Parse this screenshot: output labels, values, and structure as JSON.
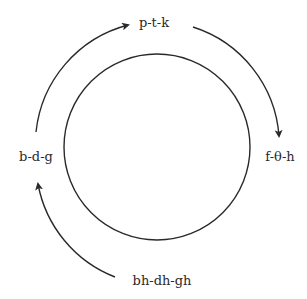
{
  "diagram": {
    "type": "cycle",
    "stroke_color": "#2a2a2a",
    "background": "#ffffff",
    "center_circle": {
      "cx": 157,
      "cy": 147,
      "r": 93
    },
    "nodes": [
      {
        "id": "top",
        "label": "p-t-k",
        "x": 154,
        "y": 22
      },
      {
        "id": "right",
        "label": "f-θ-h",
        "x": 280,
        "y": 155
      },
      {
        "id": "bottom",
        "label": "bh-dh-gh",
        "x": 162,
        "y": 280
      },
      {
        "id": "left",
        "label": "b-d-g",
        "x": 36,
        "y": 155
      }
    ],
    "arrows": [
      {
        "from": "left",
        "to": "top",
        "direction": "clockwise"
      },
      {
        "from": "top",
        "to": "right",
        "direction": "clockwise"
      },
      {
        "from": "bottom",
        "to": "left",
        "direction": "clockwise"
      }
    ]
  }
}
